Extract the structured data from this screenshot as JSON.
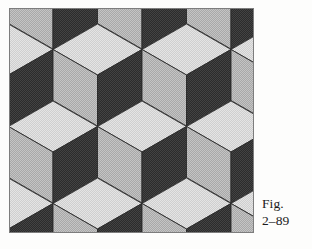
{
  "page": {
    "background_color": "#fdfdfc"
  },
  "caption": {
    "line1": "Fig.",
    "line2": "2–89",
    "full": "Fig. 2–89"
  },
  "figure": {
    "frame": {
      "x": 9,
      "y": 8,
      "width": 245,
      "height": 225,
      "border_color": "#7d7d7d",
      "border_width": 1
    },
    "pattern": {
      "type": "isometric-cube-tessellation",
      "cube_count_visible": 12,
      "grid": {
        "columns": 3,
        "rows": 3,
        "x_pitch": 89,
        "y_pitch": 77,
        "x_origin": 44,
        "y_origin": -10,
        "row_x_offset": 0
      },
      "cube_geometry": {
        "half_width": 44.5,
        "top_half_height": 25.5,
        "side_height": 51
      },
      "faces": {
        "top": {
          "name": "top-face",
          "color": "#dedede",
          "tone": "light"
        },
        "left": {
          "name": "left-face",
          "color": "#b9b9b9",
          "tone": "medium"
        },
        "right": {
          "name": "right-face",
          "color": "#3a3a3a",
          "tone": "dark"
        }
      },
      "edge_color": "#2a2a2a",
      "edge_width": 0.9
    }
  }
}
